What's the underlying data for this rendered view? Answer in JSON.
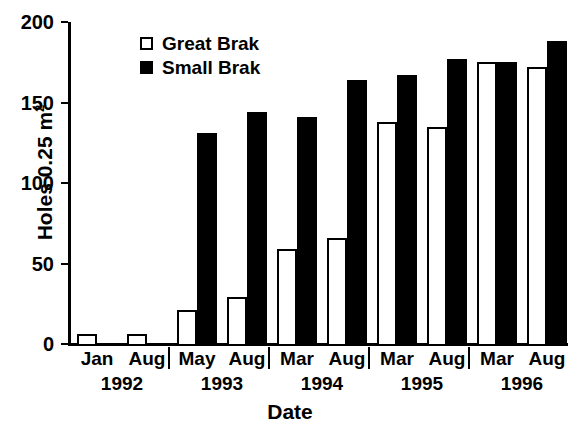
{
  "chart_data": {
    "type": "bar",
    "title": "",
    "xlabel": "Date",
    "ylabel": "Holes 0.25 m",
    "ylabel_superscript": "2",
    "ylim": [
      0,
      200
    ],
    "yticks": [
      0,
      50,
      100,
      150,
      200
    ],
    "ytick_labels": [
      "0",
      "50",
      "100",
      "150",
      "200"
    ],
    "grid": false,
    "legend_position": "top-left-inside",
    "categories": [
      "Jan",
      "Aug",
      "May",
      "Aug",
      "Mar",
      "Aug",
      "Mar",
      "Aug",
      "Mar",
      "Aug"
    ],
    "group_labels": [
      "1992",
      "1993",
      "1994",
      "1995",
      "1996"
    ],
    "groups": [
      {
        "year": "1992",
        "points": [
          {
            "month": "Jan",
            "great_brak": 6,
            "small_brak": null
          },
          {
            "month": "Aug",
            "great_brak": 6,
            "small_brak": null
          }
        ]
      },
      {
        "year": "1993",
        "points": [
          {
            "month": "May",
            "great_brak": 21,
            "small_brak": 131
          },
          {
            "month": "Aug",
            "great_brak": 29,
            "small_brak": 144
          }
        ]
      },
      {
        "year": "1994",
        "points": [
          {
            "month": "Mar",
            "great_brak": 59,
            "small_brak": 141
          },
          {
            "month": "Aug",
            "great_brak": 66,
            "small_brak": 164
          }
        ]
      },
      {
        "year": "1995",
        "points": [
          {
            "month": "Mar",
            "great_brak": 138,
            "small_brak": 167
          },
          {
            "month": "Aug",
            "great_brak": 135,
            "small_brak": 177
          }
        ]
      },
      {
        "year": "1996",
        "points": [
          {
            "month": "Mar",
            "great_brak": 175,
            "small_brak": 175
          },
          {
            "month": "Aug",
            "great_brak": 172,
            "small_brak": 188
          }
        ]
      }
    ],
    "series": [
      {
        "name": "Great Brak",
        "color": "#ffffff",
        "edge_color": "#000000",
        "values": [
          6,
          6,
          21,
          29,
          59,
          66,
          138,
          135,
          175,
          172
        ]
      },
      {
        "name": "Small Brak",
        "color": "#000000",
        "edge_color": "#000000",
        "values": [
          null,
          null,
          131,
          144,
          141,
          164,
          167,
          177,
          175,
          188
        ]
      }
    ]
  },
  "legend": {
    "items": [
      {
        "label": "Great Brak",
        "swatch": "open"
      },
      {
        "label": "Small Brak",
        "swatch": "filled"
      }
    ]
  }
}
